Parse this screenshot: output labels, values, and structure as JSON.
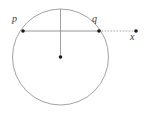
{
  "figure": {
    "type": "geometry-diagram",
    "background_color": "#ffffff",
    "stroke_color": "#8a8a8a",
    "label_color": "#3a3a3a",
    "point_color": "#1a1a1a",
    "canvas": {
      "width": 154,
      "height": 115
    },
    "circle": {
      "name": "main-circle",
      "cx": 60.5,
      "cy": 57,
      "r": 48,
      "stroke_width": 0.8
    },
    "points": [
      {
        "id": "p",
        "label": "p",
        "x": 23,
        "y": 31,
        "r": 1.8
      },
      {
        "id": "q",
        "label": "q",
        "x": 99,
        "y": 31,
        "r": 1.8
      },
      {
        "id": "x",
        "label": "x",
        "x": 136,
        "y": 31,
        "r": 1.8
      },
      {
        "id": "center",
        "label": "",
        "x": 60.5,
        "y": 57,
        "r": 1.8
      }
    ],
    "segments": [
      {
        "name": "chord-pq",
        "style": "solid",
        "x1": 23,
        "y1": 31,
        "x2": 99,
        "y2": 31,
        "stroke_width": 0.9
      },
      {
        "name": "ray-qx",
        "style": "dotted",
        "x1": 99,
        "y1": 31,
        "x2": 136,
        "y2": 31,
        "stroke_width": 0.9,
        "dash": "0.8 2.2"
      },
      {
        "name": "radius-vertical",
        "style": "solid",
        "x1": 60.5,
        "y1": 9,
        "x2": 60.5,
        "y2": 57,
        "stroke_width": 0.8
      }
    ],
    "labels": {
      "p": "p",
      "q": "q",
      "x": "x"
    }
  }
}
